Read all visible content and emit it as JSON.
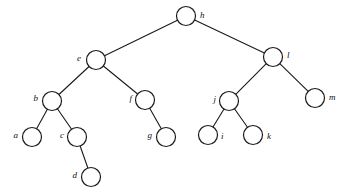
{
  "figure": {
    "type": "tree-diagram",
    "background_color": "#ffffff",
    "stroke_color": "#1a1a1a",
    "node_fill_color": "#ffffff",
    "node_radius": 9.5,
    "width": 347,
    "height": 196
  },
  "nodes": [
    {
      "id": "h",
      "label": "h",
      "cx": 186,
      "cy": 16,
      "label_side": "right",
      "label_x": 200,
      "label_y": 16
    },
    {
      "id": "e",
      "label": "e",
      "cx": 96,
      "cy": 60,
      "label_side": "left",
      "label_x": 81,
      "label_y": 59
    },
    {
      "id": "l",
      "label": "l",
      "cx": 273,
      "cy": 57,
      "label_side": "right",
      "label_x": 287,
      "label_y": 56
    },
    {
      "id": "b",
      "label": "b",
      "cx": 52,
      "cy": 101,
      "label_side": "left",
      "label_x": 38,
      "label_y": 99
    },
    {
      "id": "f",
      "label": "f",
      "cx": 145,
      "cy": 100,
      "label_side": "left",
      "label_x": 132,
      "label_y": 99
    },
    {
      "id": "j",
      "label": "j",
      "cx": 229,
      "cy": 101,
      "label_side": "left",
      "label_x": 216,
      "label_y": 100
    },
    {
      "id": "m",
      "label": "m",
      "cx": 315,
      "cy": 98,
      "label_side": "right",
      "label_x": 329,
      "label_y": 98
    },
    {
      "id": "a",
      "label": "a",
      "cx": 32,
      "cy": 137,
      "label_side": "left",
      "label_x": 18,
      "label_y": 136
    },
    {
      "id": "c",
      "label": "c",
      "cx": 77,
      "cy": 137,
      "label_side": "left",
      "label_x": 64,
      "label_y": 136
    },
    {
      "id": "g",
      "label": "g",
      "cx": 166,
      "cy": 137,
      "label_side": "left",
      "label_x": 152,
      "label_y": 136
    },
    {
      "id": "i",
      "label": "i",
      "cx": 208,
      "cy": 135,
      "label_side": "right",
      "label_x": 221,
      "label_y": 137
    },
    {
      "id": "k",
      "label": "k",
      "cx": 253,
      "cy": 135,
      "label_side": "right",
      "label_x": 267,
      "label_y": 137
    },
    {
      "id": "d",
      "label": "d",
      "cx": 91,
      "cy": 177,
      "label_side": "left",
      "label_x": 77,
      "label_y": 176
    }
  ],
  "edges": [
    {
      "from": "h",
      "to": "e"
    },
    {
      "from": "h",
      "to": "l"
    },
    {
      "from": "e",
      "to": "b"
    },
    {
      "from": "e",
      "to": "f"
    },
    {
      "from": "b",
      "to": "a"
    },
    {
      "from": "b",
      "to": "c"
    },
    {
      "from": "c",
      "to": "d"
    },
    {
      "from": "f",
      "to": "g"
    },
    {
      "from": "l",
      "to": "j"
    },
    {
      "from": "l",
      "to": "m"
    },
    {
      "from": "j",
      "to": "i"
    },
    {
      "from": "j",
      "to": "k"
    }
  ]
}
